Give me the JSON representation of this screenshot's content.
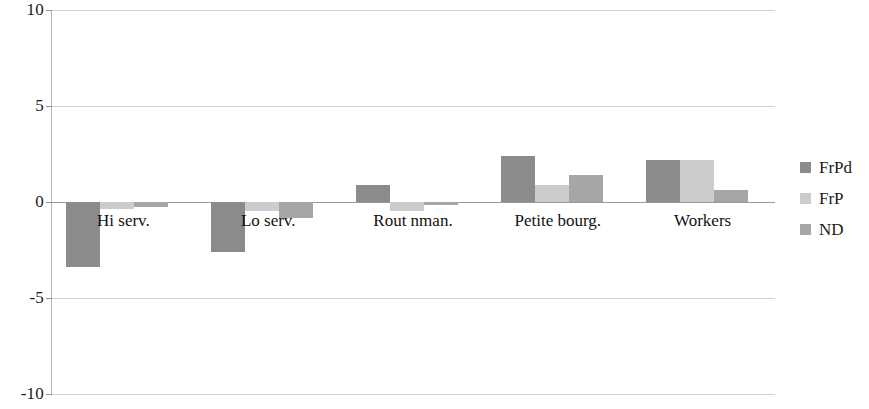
{
  "chart_data": {
    "type": "bar",
    "title": "",
    "subtitle": "",
    "xlabel": "",
    "ylabel": "",
    "grid": true,
    "legend_position": "right",
    "categories": [
      "Hi serv.",
      "Lo serv.",
      "Rout nman.",
      "Petite bourg.",
      "Workers"
    ],
    "ylim": [
      -10,
      10
    ],
    "yticks": [
      10,
      5,
      0,
      -5,
      -10
    ],
    "ytick_labels": [
      "10",
      "5",
      "0",
      "-5",
      "-10"
    ],
    "series": [
      {
        "name": "FrPd",
        "color": "#8b8b8b",
        "values": [
          -3.4,
          -2.6,
          0.9,
          2.4,
          2.2
        ]
      },
      {
        "name": "FrP",
        "color": "#cccccc",
        "values": [
          -0.35,
          -0.45,
          -0.45,
          0.9,
          2.2
        ]
      },
      {
        "name": "ND",
        "color": "#a6a6a6",
        "values": [
          -0.25,
          -0.85,
          -0.15,
          1.4,
          0.6
        ]
      }
    ]
  },
  "legend": {
    "items": [
      {
        "label": "FrPd",
        "color": "#8b8b8b"
      },
      {
        "label": "FrP",
        "color": "#cccccc"
      },
      {
        "label": "ND",
        "color": "#a6a6a6"
      }
    ]
  },
  "axis": {
    "y_tick_labels": [
      "10",
      "5",
      "0",
      "-5",
      "-10"
    ]
  }
}
